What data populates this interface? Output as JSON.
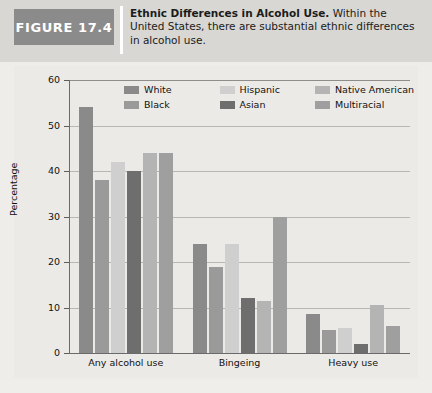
{
  "figure": {
    "badge_label": "FIGURE 17.4",
    "caption_title": "Ethnic Differences in Alcohol Use.",
    "caption_body": " Within the United States, there are substantial ethnic differences in alcohol use."
  },
  "chart_data": {
    "type": "bar",
    "title": "Ethnic Differences in Alcohol Use",
    "xlabel": "",
    "ylabel": "Percentage",
    "ylim": [
      0,
      60
    ],
    "yticks": [
      0,
      10,
      20,
      30,
      40,
      50,
      60
    ],
    "grid": true,
    "legend_position": "top",
    "categories": [
      "Any alcohol use",
      "Bingeing",
      "Heavy use"
    ],
    "series": [
      {
        "name": "White",
        "color": "#8a8a8a",
        "values": [
          54,
          24,
          8.5
        ]
      },
      {
        "name": "Black",
        "color": "#9a9a9a",
        "values": [
          38,
          19,
          5
        ]
      },
      {
        "name": "Hispanic",
        "color": "#cfcfcf",
        "values": [
          42,
          24,
          5.5
        ]
      },
      {
        "name": "Asian",
        "color": "#6e6e6e",
        "values": [
          40,
          12,
          2
        ]
      },
      {
        "name": "Native American",
        "color": "#b4b4b4",
        "values": [
          44,
          11.5,
          10.5
        ]
      },
      {
        "name": "Multiracial",
        "color": "#9f9f9f",
        "values": [
          44,
          30,
          6
        ]
      }
    ]
  },
  "colors": {
    "badge_background": "#8b8b8b",
    "header_background": "#d8d7d3",
    "plot_background": "#eceae6",
    "axis": "#6a6a6a",
    "gridline": "#b9b7b2"
  }
}
